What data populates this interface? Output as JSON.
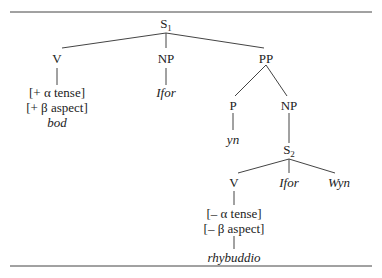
{
  "tree": {
    "root": {
      "label": "S",
      "sub": "1"
    },
    "v1": {
      "label": "V",
      "features": [
        "[+ α tense]",
        "[+ β aspect]"
      ],
      "word": "bod"
    },
    "np1": {
      "label": "NP",
      "word": "Ifor"
    },
    "pp": {
      "label": "PP"
    },
    "p": {
      "label": "P",
      "word": "yn"
    },
    "np2": {
      "label": "NP"
    },
    "s2": {
      "label": "S",
      "sub": "2"
    },
    "v2": {
      "label": "V",
      "features": [
        "[– α tense]",
        "[– β aspect]"
      ],
      "word": "rhybuddio"
    },
    "s2_ifor": {
      "word": "Ifor"
    },
    "s2_wyn": {
      "word": "Wyn"
    }
  }
}
